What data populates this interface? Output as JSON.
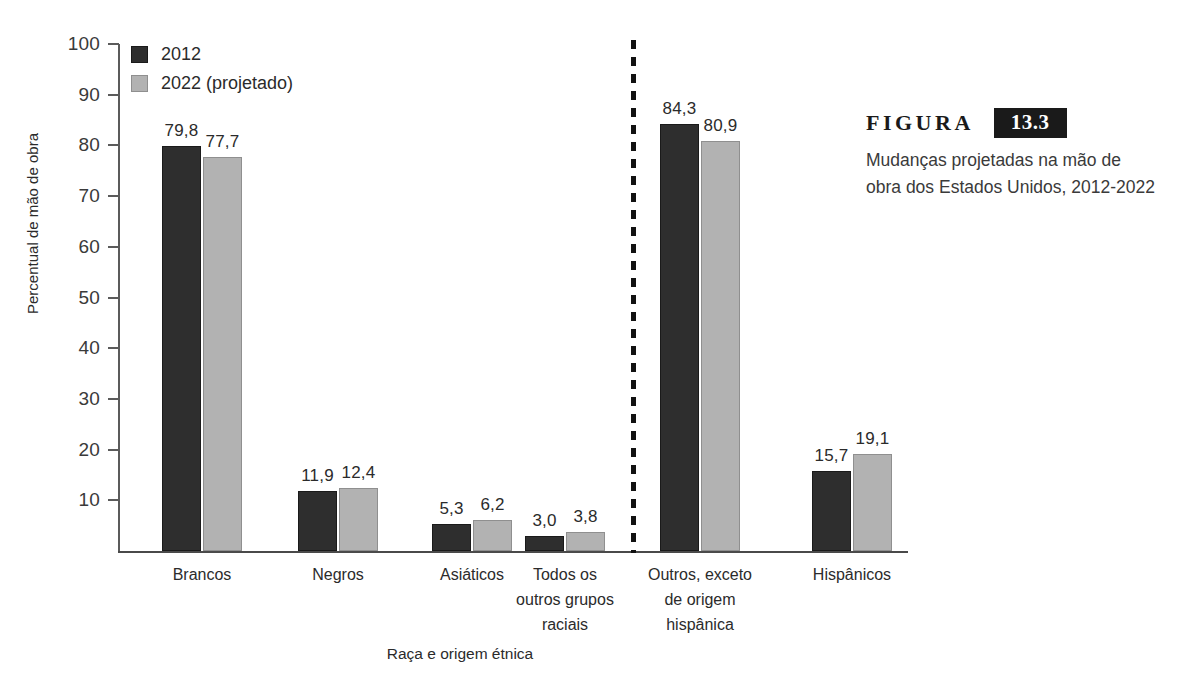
{
  "chart_data": {
    "type": "bar",
    "title": "Mudanças projetadas na mão de obra dos Estados Unidos, 2012-2022",
    "xlabel": "Raça e origem étnica",
    "ylabel": "Percentual de mão de obra",
    "ylim": [
      0,
      100
    ],
    "yticks": [
      100,
      90,
      80,
      70,
      60,
      50,
      40,
      30,
      20,
      10
    ],
    "grid": false,
    "legend_position": "top-left",
    "categories": [
      "Brancos",
      "Negros",
      "Asiáticos",
      "Todos os\noutros grupos\nraciais",
      "Outros, exceto\nde origem\nhispânica",
      "Hispânicos"
    ],
    "series": [
      {
        "name": "2012",
        "color": "#2e2e2e",
        "values": [
          79.8,
          11.9,
          5.3,
          3.0,
          84.3,
          15.7
        ],
        "labels": [
          "79,8",
          "11,9",
          "5,3",
          "3,0",
          "84,3",
          "15,7"
        ]
      },
      {
        "name": "2022 (projetado)",
        "color": "#b2b2b2",
        "values": [
          77.7,
          12.4,
          6.2,
          3.8,
          80.9,
          19.1
        ],
        "labels": [
          "77,7",
          "12,4",
          "6,2",
          "3,8",
          "80,9",
          "19,1"
        ]
      }
    ],
    "divider_after_category_index": 3,
    "divider_style": "dashed"
  },
  "legend": {
    "items": [
      {
        "label": "2012",
        "color": "#2e2e2e"
      },
      {
        "label": "2022 (projetado)",
        "color": "#b2b2b2"
      }
    ]
  },
  "caption": {
    "figura_label": "FIGURA",
    "figure_number": "13.3",
    "text": "Mudanças projetadas na mão de obra dos Estados Unidos, 2012-2022"
  }
}
